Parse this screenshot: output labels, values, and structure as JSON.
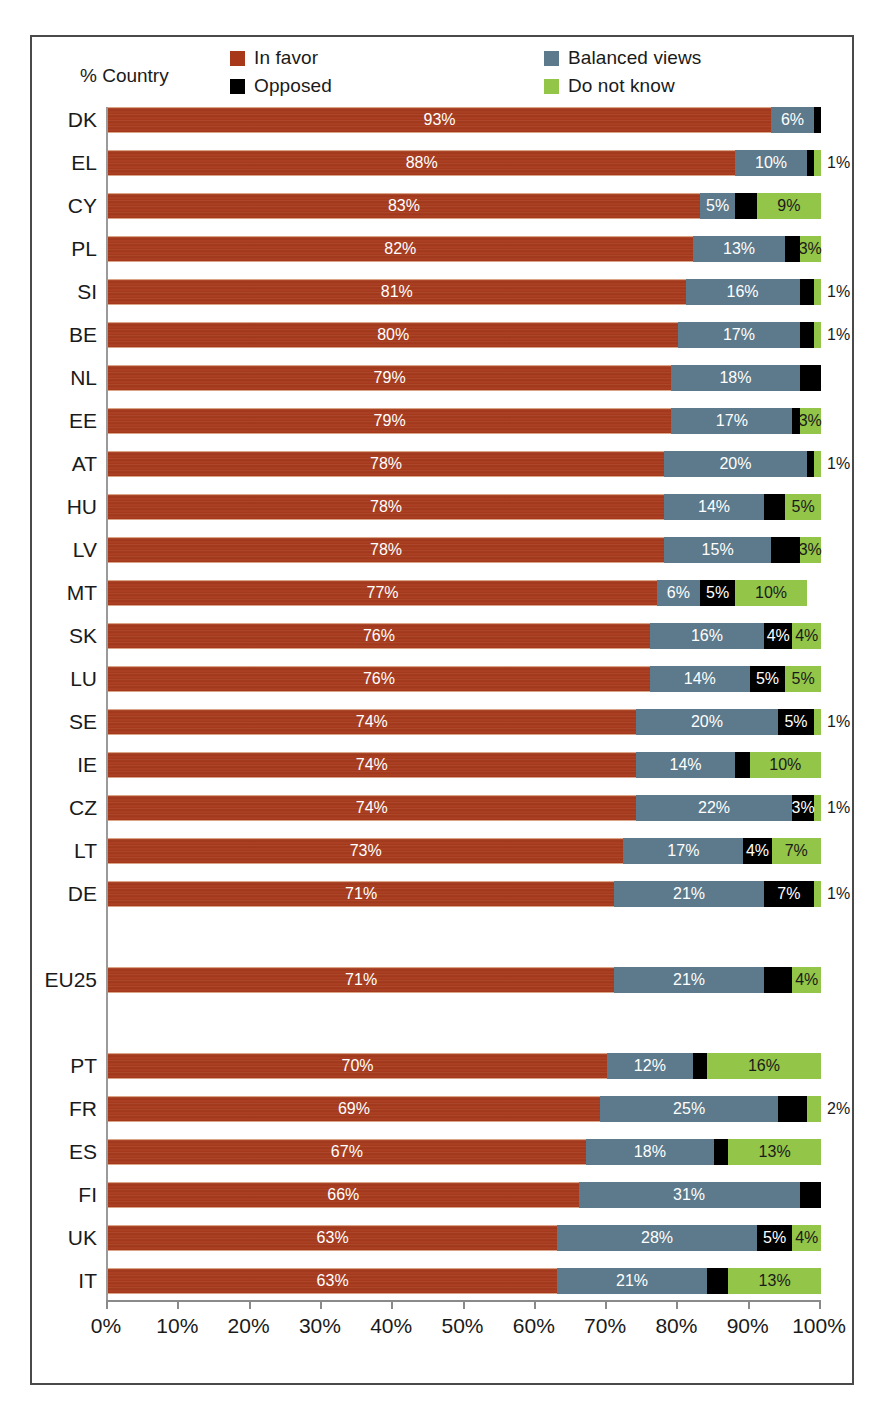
{
  "figure": {
    "axis_caption": "% Country"
  },
  "legend": {
    "items": [
      {
        "key": "favor",
        "label": "In favor",
        "color": "#a8381a"
      },
      {
        "key": "opposed",
        "label": "Opposed",
        "color": "#000000"
      },
      {
        "key": "balanced",
        "label": "Balanced views",
        "color": "#5c7a8c"
      },
      {
        "key": "dontknow",
        "label": "Do not know",
        "color": "#93c548"
      }
    ]
  },
  "chart_data": {
    "type": "bar",
    "subtype": "stacked-horizontal-100",
    "title": "",
    "xlabel": "",
    "ylabel": "% Country",
    "xlim": [
      0,
      100
    ],
    "grid": false,
    "legend_position": "top",
    "series": [
      {
        "name": "In favor",
        "key": "favor",
        "color": "#a8381a"
      },
      {
        "name": "Balanced views",
        "key": "balanced",
        "color": "#5c7a8c"
      },
      {
        "name": "Opposed",
        "key": "opposed",
        "color": "#000000"
      },
      {
        "name": "Do not know",
        "key": "dontknow",
        "color": "#93c548"
      }
    ],
    "categories": [
      "DK",
      "EL",
      "CY",
      "PL",
      "SI",
      "BE",
      "NL",
      "EE",
      "AT",
      "HU",
      "LV",
      "MT",
      "SK",
      "LU",
      "SE",
      "IE",
      "CZ",
      "LT",
      "DE",
      "EU25",
      "PT",
      "FR",
      "ES",
      "FI",
      "UK",
      "IT"
    ],
    "xticks": [
      0,
      10,
      20,
      30,
      40,
      50,
      60,
      70,
      80,
      90,
      100
    ],
    "xticklabels": [
      "0%",
      "10%",
      "20%",
      "30%",
      "40%",
      "50%",
      "60%",
      "70%",
      "80%",
      "90%",
      "100%"
    ],
    "rows": [
      {
        "category": "DK",
        "gap_before": 0,
        "favor": 93,
        "balanced": 6,
        "opposed": 1,
        "dontknow": 0,
        "labels": {
          "favor": "93%",
          "balanced": "6%",
          "opposed": "",
          "dontknow": ""
        },
        "outside": ""
      },
      {
        "category": "EL",
        "gap_before": 0,
        "favor": 88,
        "balanced": 10,
        "opposed": 1,
        "dontknow": 1,
        "labels": {
          "favor": "88%",
          "balanced": "10%",
          "opposed": "",
          "dontknow": ""
        },
        "outside": "1%"
      },
      {
        "category": "CY",
        "gap_before": 0,
        "favor": 83,
        "balanced": 5,
        "opposed": 3,
        "dontknow": 9,
        "labels": {
          "favor": "83%",
          "balanced": "5%",
          "opposed": "",
          "dontknow": "9%"
        },
        "outside": ""
      },
      {
        "category": "PL",
        "gap_before": 0,
        "favor": 82,
        "balanced": 13,
        "opposed": 2,
        "dontknow": 3,
        "labels": {
          "favor": "82%",
          "balanced": "13%",
          "opposed": "",
          "dontknow": "3%"
        },
        "outside": ""
      },
      {
        "category": "SI",
        "gap_before": 0,
        "favor": 81,
        "balanced": 16,
        "opposed": 2,
        "dontknow": 1,
        "labels": {
          "favor": "81%",
          "balanced": "16%",
          "opposed": "",
          "dontknow": ""
        },
        "outside": "1%"
      },
      {
        "category": "BE",
        "gap_before": 0,
        "favor": 80,
        "balanced": 17,
        "opposed": 2,
        "dontknow": 1,
        "labels": {
          "favor": "80%",
          "balanced": "17%",
          "opposed": "",
          "dontknow": ""
        },
        "outside": "1%"
      },
      {
        "category": "NL",
        "gap_before": 0,
        "favor": 79,
        "balanced": 18,
        "opposed": 3,
        "dontknow": 0,
        "labels": {
          "favor": "79%",
          "balanced": "18%",
          "opposed": "",
          "dontknow": ""
        },
        "outside": ""
      },
      {
        "category": "EE",
        "gap_before": 0,
        "favor": 79,
        "balanced": 17,
        "opposed": 1,
        "dontknow": 3,
        "labels": {
          "favor": "79%",
          "balanced": "17%",
          "opposed": "",
          "dontknow": "3%"
        },
        "outside": ""
      },
      {
        "category": "AT",
        "gap_before": 0,
        "favor": 78,
        "balanced": 20,
        "opposed": 1,
        "dontknow": 1,
        "labels": {
          "favor": "78%",
          "balanced": "20%",
          "opposed": "",
          "dontknow": ""
        },
        "outside": "1%"
      },
      {
        "category": "HU",
        "gap_before": 0,
        "favor": 78,
        "balanced": 14,
        "opposed": 3,
        "dontknow": 5,
        "labels": {
          "favor": "78%",
          "balanced": "14%",
          "opposed": "",
          "dontknow": "5%"
        },
        "outside": ""
      },
      {
        "category": "LV",
        "gap_before": 0,
        "favor": 78,
        "balanced": 15,
        "opposed": 4,
        "dontknow": 3,
        "labels": {
          "favor": "78%",
          "balanced": "15%",
          "opposed": "",
          "dontknow": "3%"
        },
        "outside": ""
      },
      {
        "category": "MT",
        "gap_before": 0,
        "favor": 77,
        "balanced": 6,
        "opposed": 5,
        "dontknow": 10,
        "labels": {
          "favor": "77%",
          "balanced": "6%",
          "opposed": "5%",
          "dontknow": "10%"
        },
        "outside": ""
      },
      {
        "category": "SK",
        "gap_before": 0,
        "favor": 76,
        "balanced": 16,
        "opposed": 4,
        "dontknow": 4,
        "labels": {
          "favor": "76%",
          "balanced": "16%",
          "opposed": "4%",
          "dontknow": "4%"
        },
        "outside": ""
      },
      {
        "category": "LU",
        "gap_before": 0,
        "favor": 76,
        "balanced": 14,
        "opposed": 5,
        "dontknow": 5,
        "labels": {
          "favor": "76%",
          "balanced": "14%",
          "opposed": "5%",
          "dontknow": "5%"
        },
        "outside": ""
      },
      {
        "category": "SE",
        "gap_before": 0,
        "favor": 74,
        "balanced": 20,
        "opposed": 5,
        "dontknow": 1,
        "labels": {
          "favor": "74%",
          "balanced": "20%",
          "opposed": "5%",
          "dontknow": ""
        },
        "outside": "1%"
      },
      {
        "category": "IE",
        "gap_before": 0,
        "favor": 74,
        "balanced": 14,
        "opposed": 2,
        "dontknow": 10,
        "labels": {
          "favor": "74%",
          "balanced": "14%",
          "opposed": "",
          "dontknow": "10%"
        },
        "outside": ""
      },
      {
        "category": "CZ",
        "gap_before": 0,
        "favor": 74,
        "balanced": 22,
        "opposed": 3,
        "dontknow": 1,
        "labels": {
          "favor": "74%",
          "balanced": "22%",
          "opposed": "3%",
          "dontknow": ""
        },
        "outside": "1%"
      },
      {
        "category": "LT",
        "gap_before": 0,
        "favor": 73,
        "balanced": 17,
        "opposed": 4,
        "dontknow": 7,
        "labels": {
          "favor": "73%",
          "balanced": "17%",
          "opposed": "4%",
          "dontknow": "7%"
        },
        "outside": ""
      },
      {
        "category": "DE",
        "gap_before": 0,
        "favor": 71,
        "balanced": 21,
        "opposed": 7,
        "dontknow": 1,
        "labels": {
          "favor": "71%",
          "balanced": "21%",
          "opposed": "7%",
          "dontknow": ""
        },
        "outside": "1%"
      },
      {
        "category": "EU25",
        "gap_before": 43,
        "favor": 71,
        "balanced": 21,
        "opposed": 4,
        "dontknow": 4,
        "labels": {
          "favor": "71%",
          "balanced": "21%",
          "opposed": "",
          "dontknow": "4%"
        },
        "outside": ""
      },
      {
        "category": "PT",
        "gap_before": 43,
        "favor": 70,
        "balanced": 12,
        "opposed": 2,
        "dontknow": 16,
        "labels": {
          "favor": "70%",
          "balanced": "12%",
          "opposed": "",
          "dontknow": "16%"
        },
        "outside": ""
      },
      {
        "category": "FR",
        "gap_before": 0,
        "favor": 69,
        "balanced": 25,
        "opposed": 4,
        "dontknow": 2,
        "labels": {
          "favor": "69%",
          "balanced": "25%",
          "opposed": "",
          "dontknow": ""
        },
        "outside": "2%"
      },
      {
        "category": "ES",
        "gap_before": 0,
        "favor": 67,
        "balanced": 18,
        "opposed": 2,
        "dontknow": 13,
        "labels": {
          "favor": "67%",
          "balanced": "18%",
          "opposed": "",
          "dontknow": "13%"
        },
        "outside": ""
      },
      {
        "category": "FI",
        "gap_before": 0,
        "favor": 66,
        "balanced": 31,
        "opposed": 3,
        "dontknow": 0,
        "labels": {
          "favor": "66%",
          "balanced": "31%",
          "opposed": "",
          "dontknow": ""
        },
        "outside": ""
      },
      {
        "category": "UK",
        "gap_before": 0,
        "favor": 63,
        "balanced": 28,
        "opposed": 5,
        "dontknow": 4,
        "labels": {
          "favor": "63%",
          "balanced": "28%",
          "opposed": "5%",
          "dontknow": "4%"
        },
        "outside": ""
      },
      {
        "category": "IT",
        "gap_before": 0,
        "favor": 63,
        "balanced": 21,
        "opposed": 3,
        "dontknow": 13,
        "labels": {
          "favor": "63%",
          "balanced": "21%",
          "opposed": "",
          "dontknow": "13%"
        },
        "outside": ""
      }
    ]
  }
}
